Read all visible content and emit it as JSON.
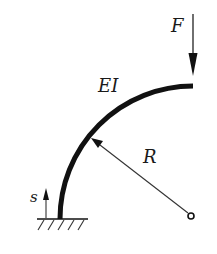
{
  "diagram": {
    "labels": {
      "force": "F",
      "stiffness": "EI",
      "radius": "R",
      "arc_coordinate": "s"
    },
    "colors": {
      "stroke": "#111111",
      "background": "#ffffff"
    }
  }
}
